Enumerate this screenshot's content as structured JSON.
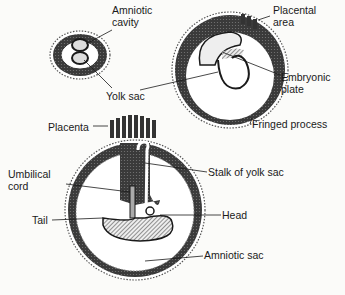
{
  "labels": {
    "amniotic_cavity": [
      "Amniotic",
      "cavity"
    ],
    "yolk_sac": "Yolk sac",
    "placental_area": [
      "Placental",
      "area"
    ],
    "embryonic_plate": [
      "Embryonic",
      "plate"
    ],
    "fringed_process": "Fringed process",
    "placenta": "Placenta",
    "umbilical_cord": [
      "Umbilical",
      "cord"
    ],
    "tail": "Tail",
    "stalk_of_yolk_sac": "Stalk of yolk sac",
    "head": "Head",
    "amniotic_sac": "Amniotic sac"
  },
  "colors": {
    "ink": "#1a1a1a",
    "shade": "#3a3a3a",
    "paper": "#fbfbf9"
  }
}
